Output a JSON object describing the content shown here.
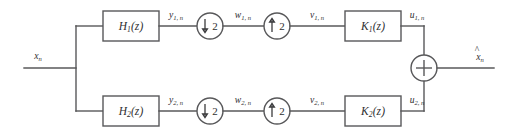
{
  "figure": {
    "type": "block-diagram",
    "line_color": "#58585a",
    "text_color": "#2e2e30",
    "background": "#ffffff"
  },
  "input": {
    "label_base": "x",
    "label_sub": "n",
    "name": "input-signal"
  },
  "output": {
    "label_base": "x",
    "label_sub": "n",
    "hat": "^",
    "name": "reconstructed-output-signal"
  },
  "branches": [
    {
      "id": "upper",
      "analysis_filter": {
        "base": "H",
        "index": "1",
        "arg": "(z)"
      },
      "analysis_output": {
        "base": "y",
        "sub": "1, n"
      },
      "downsampler": {
        "arrow": "down",
        "factor": "2"
      },
      "downsampled_signal": {
        "base": "w",
        "sub": "1, n"
      },
      "upsampler": {
        "arrow": "up",
        "factor": "2"
      },
      "upsampled_signal": {
        "base": "v",
        "sub": "1, n"
      },
      "synthesis_filter": {
        "base": "K",
        "index": "1",
        "arg": "(z)"
      },
      "synthesis_output": {
        "base": "u",
        "sub": "1, n"
      }
    },
    {
      "id": "lower",
      "analysis_filter": {
        "base": "H",
        "index": "2",
        "arg": "(z)"
      },
      "analysis_output": {
        "base": "y",
        "sub": "2, n"
      },
      "downsampler": {
        "arrow": "down",
        "factor": "2"
      },
      "downsampled_signal": {
        "base": "w",
        "sub": "2, n"
      },
      "upsampler": {
        "arrow": "up",
        "factor": "2"
      },
      "upsampled_signal": {
        "base": "v",
        "sub": "2, n"
      },
      "synthesis_filter": {
        "base": "K",
        "index": "2",
        "arg": "(z)"
      },
      "synthesis_output": {
        "base": "u",
        "sub": "2, n"
      }
    }
  ],
  "adder": {
    "symbol": "+",
    "name": "summing-junction"
  }
}
